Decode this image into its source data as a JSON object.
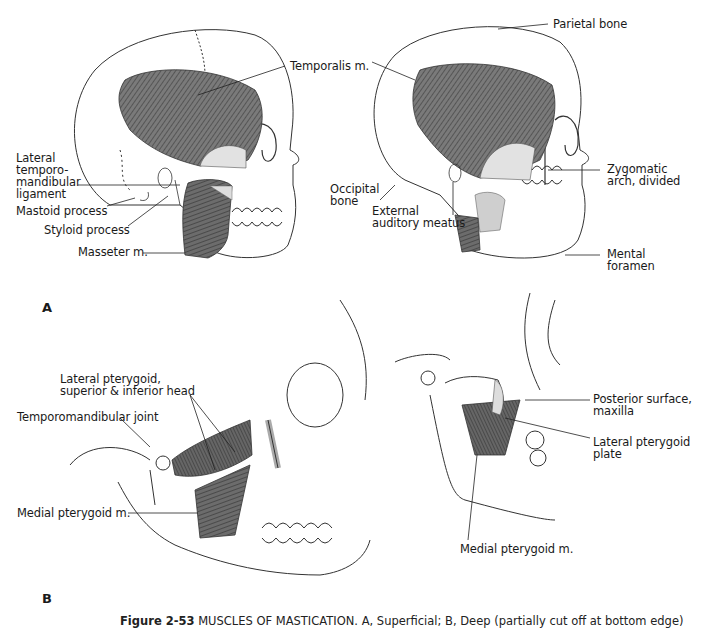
{
  "figure": {
    "caption_number": "Figure 2-53",
    "caption_text": "MUSCLES OF MASTICATION. A, Superficial; B, Deep (partially cut off at bottom edge)",
    "caption_visible": "Figure 2-53  MUSCLES OF MASTICATION. A, Superficial. B, the ... muscles and"
  },
  "panels": {
    "a": "A",
    "b": "B"
  },
  "labels_a_left": {
    "temporalis": "Temporalis m.",
    "lateral_tm_ligament": "Lateral\ntemporo-\nmandibular\nligament",
    "mastoid": "Mastoid process",
    "styloid": "Styloid process",
    "masseter": "Masseter m."
  },
  "labels_a_right": {
    "parietal": "Parietal bone",
    "zygomatic": "Zygomatic\narch, divided",
    "occipital": "Occipital\nbone",
    "auditory": "External\nauditory meatus",
    "mental": "Mental\nforamen"
  },
  "labels_b_left": {
    "lateral_pterygoid": "Lateral pterygoid,\nsuperior & inferior head",
    "tmj": "Temporomandibular joint",
    "medial_pterygoid": "Medial pterygoid m."
  },
  "labels_b_right": {
    "posterior_surface": "Posterior surface,\nmaxilla",
    "lateral_plate": "Lateral pterygoid\nplate",
    "medial_pterygoid": "Medial pterygoid m."
  },
  "colors": {
    "ink": "#1a1a1a",
    "muscle": "#6f6f6f",
    "muscle_dark": "#4a4a4a",
    "tendon": "#d9d9d9",
    "bone_line": "#333333"
  }
}
